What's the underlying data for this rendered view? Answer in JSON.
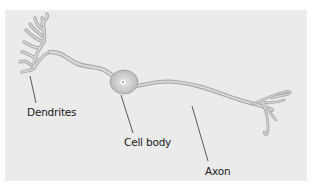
{
  "diagram": {
    "background_color": "#ebebeb",
    "neuron_fill": "#d3d3d3",
    "neuron_outline": "#a8a8a8",
    "labels": [
      {
        "id": "dendrites",
        "text": "Dendrites"
      },
      {
        "id": "cell_body",
        "text": "Cell body"
      },
      {
        "id": "axon",
        "text": "Axon"
      }
    ]
  }
}
